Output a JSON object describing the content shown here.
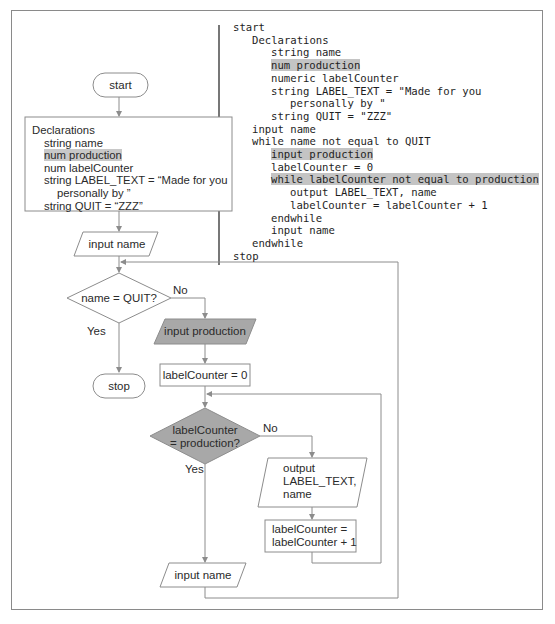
{
  "flowchart": {
    "start": "start",
    "declarations": {
      "title": "Declarations",
      "lines": [
        {
          "text": "string name",
          "indent": 1,
          "highlight": false
        },
        {
          "text": "num production",
          "indent": 1,
          "highlight": true
        },
        {
          "text": "num labelCounter",
          "indent": 1,
          "highlight": false
        },
        {
          "text": "string LABEL_TEXT = “Made for you",
          "indent": 1,
          "highlight": false
        },
        {
          "text": "personally by ”",
          "indent": 2,
          "highlight": false
        },
        {
          "text": "string QUIT = “ZZZ”",
          "indent": 1,
          "highlight": false
        }
      ]
    },
    "input_name_top": "input name",
    "decision_quit": "name = QUIT?",
    "decision_quit_no": "No",
    "decision_quit_yes": "Yes",
    "stop": "stop",
    "input_production": "input production",
    "init_counter": "labelCounter = 0",
    "decision_counter_line1": "labelCounter",
    "decision_counter_line2": "= production?",
    "decision_counter_no": "No",
    "decision_counter_yes": "Yes",
    "output_line1": "output",
    "output_line2": "LABEL_TEXT,",
    "output_line3": "name",
    "increment_line1": "labelCounter =",
    "increment_line2": "labelCounter + 1",
    "input_name_bottom": "input name",
    "colors": {
      "highlight_fill": "#a8a8a8",
      "line": "#8c8c8c",
      "text_highlight": "#c8c8c8"
    }
  },
  "pseudocode": {
    "lines": [
      {
        "text": "start",
        "indent": 0,
        "highlight": false
      },
      {
        "text": "Declarations",
        "indent": 1,
        "highlight": false
      },
      {
        "text": "string name",
        "indent": 2,
        "highlight": false
      },
      {
        "text": "num production",
        "indent": 2,
        "highlight": true
      },
      {
        "text": "numeric labelCounter",
        "indent": 2,
        "highlight": false
      },
      {
        "text": "string LABEL_TEXT = \"Made for you",
        "indent": 2,
        "highlight": false
      },
      {
        "text": "personally by \"",
        "indent": 3,
        "highlight": false
      },
      {
        "text": "string QUIT = \"ZZZ\"",
        "indent": 2,
        "highlight": false
      },
      {
        "text": "input name",
        "indent": 1,
        "highlight": false
      },
      {
        "text": "while name not equal to QUIT",
        "indent": 1,
        "highlight": false
      },
      {
        "text": "input production",
        "indent": 2,
        "highlight": true
      },
      {
        "text": "labelCounter = 0",
        "indent": 2,
        "highlight": false
      },
      {
        "text": "while labelCounter not equal to production",
        "indent": 2,
        "highlight": true
      },
      {
        "text": "output LABEL_TEXT, name",
        "indent": 3,
        "highlight": false
      },
      {
        "text": "labelCounter = labelCounter + 1",
        "indent": 3,
        "highlight": false
      },
      {
        "text": "endwhile",
        "indent": 2,
        "highlight": false
      },
      {
        "text": "input name",
        "indent": 2,
        "highlight": false
      },
      {
        "text": "endwhile",
        "indent": 1,
        "highlight": false
      },
      {
        "text": "stop",
        "indent": 0,
        "highlight": false
      }
    ]
  }
}
